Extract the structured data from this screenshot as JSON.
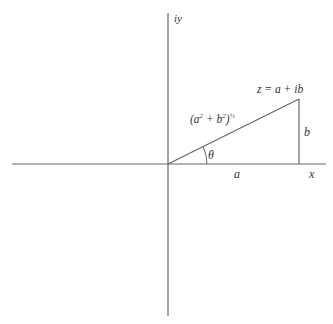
{
  "diagram": {
    "type": "complex-plane-polar-form",
    "axes": {
      "x_label": "x",
      "y_label": "iy"
    },
    "point": {
      "label": "z = a + ib"
    },
    "segments": {
      "horizontal_label": "a",
      "vertical_label": "b",
      "hypotenuse_label_base": "(a",
      "hypotenuse_label_exp1": "2",
      "hypotenuse_label_mid": " + b",
      "hypotenuse_label_exp2": "2",
      "hypotenuse_label_close": ")",
      "hypotenuse_label_exp3": "½"
    },
    "angle": {
      "label": "θ"
    },
    "colors": {
      "line": "#666666",
      "text": "#333333",
      "background": "#ffffff"
    }
  }
}
